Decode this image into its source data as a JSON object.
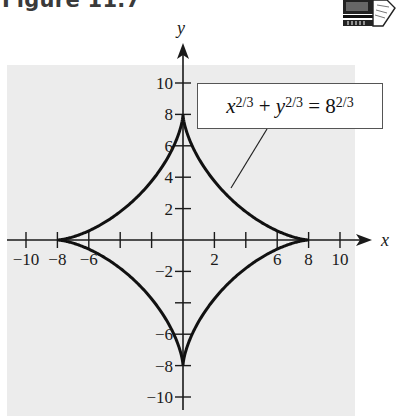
{
  "figure": {
    "title": "Figure 11.7",
    "icon": "computer-calculator-icon"
  },
  "equation": {
    "x_var": "x",
    "x_exp": "2/3",
    "plus": " + ",
    "y_var": "y",
    "y_exp": "2/3",
    "equals": " = ",
    "rhs_base": "8",
    "rhs_exp": "2/3"
  },
  "colors": {
    "background_panel": "#ececec",
    "curve": "#111111",
    "axis": "#1a1a1a"
  },
  "chart_data": {
    "type": "line",
    "title": "Figure 11.7",
    "subtitle": "",
    "curve_name": "astroid",
    "equation_label": "x^{2/3} + y^{2/3} = 8^{2/3}",
    "parametric": "x = 8cos^3(t), y = 8sin^3(t)",
    "cusps": [
      [
        8,
        0
      ],
      [
        0,
        8
      ],
      [
        -8,
        0
      ],
      [
        0,
        -8
      ]
    ],
    "xlabel": "x",
    "ylabel": "y",
    "xlim": [
      -11,
      12
    ],
    "ylim": [
      -11,
      12
    ],
    "x_ticks": [
      -10,
      -8,
      -6,
      -4,
      -2,
      2,
      4,
      6,
      8,
      10
    ],
    "x_tick_labels": [
      "-10",
      "-8",
      "-6",
      "",
      "",
      "2",
      "",
      "6",
      "8",
      "10"
    ],
    "y_ticks": [
      10,
      8,
      6,
      4,
      2,
      -2,
      -4,
      -6,
      -8,
      -10
    ],
    "y_tick_labels": [
      "10",
      "8",
      "6",
      "4",
      "2",
      "-2",
      "",
      "-6",
      "-8",
      "-10"
    ],
    "grid": false,
    "legend": "none",
    "annotation": {
      "text": "x^{2/3} + y^{2/3} = 8^{2/3}",
      "points_to": [
        2.9,
        3.3
      ]
    }
  }
}
